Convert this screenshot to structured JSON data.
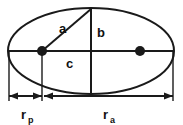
{
  "figure": {
    "type": "geometry-diagram",
    "background_color": "#ffffff",
    "stroke_color": "#1a1a1a"
  },
  "labels": {
    "semi_major": "a",
    "semi_minor": "b",
    "focal_distance": "c",
    "periapsis_radius_base": "r",
    "periapsis_radius_sub": "p",
    "apoapsis_radius_base": "r",
    "apoapsis_radius_sub": "a"
  },
  "elements": {
    "ellipse_name": "ellipse-outline",
    "major_axis_name": "major-axis-line",
    "minor_axis_name": "minor-axis-line",
    "left_focus_name": "left-focus-dot",
    "right_focus_name": "right-focus-dot",
    "semi_major_line_name": "semi-major-axis-line",
    "periapsis_dimension_name": "periapsis-dimension-line",
    "apoapsis_dimension_name": "apoapsis-dimension-line"
  },
  "geometry": {
    "center_x": 91,
    "center_y": 51,
    "semi_major_px": 83,
    "semi_minor_px": 43,
    "left_focus_x": 42,
    "right_focus_x": 140,
    "dimension_line_y": 96
  }
}
